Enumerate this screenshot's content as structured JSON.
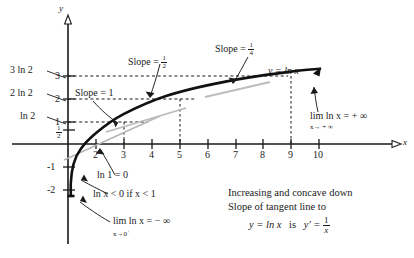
{
  "figure": {
    "curve_label": "y = ln x",
    "axes": {
      "x_axis_name": "x",
      "y_axis_name": "y",
      "x_ticks": [
        "2",
        "3",
        "4",
        "5",
        "6",
        "7",
        "8",
        "9",
        "10"
      ],
      "y_ticks_positive": [
        "1",
        "2",
        "3"
      ],
      "y_ticks_negative": [
        "-1",
        "-2"
      ],
      "y_half_tick": {
        "numerator": "1",
        "denominator": "2"
      }
    },
    "y_value_labels": [
      {
        "text": "3 ln 2",
        "value": 2.079
      },
      {
        "text": "2 ln 2",
        "value": 1.386
      },
      {
        "text": "ln 2",
        "value": 0.693
      }
    ],
    "slope_labels": [
      {
        "prefix": "Slope =",
        "value": "1",
        "at_x": 1
      },
      {
        "prefix": "Slope =",
        "numerator": "1",
        "denominator": "2",
        "at_x": 2
      },
      {
        "prefix": "Slope =",
        "numerator": "1",
        "denominator": "4",
        "at_x": 4
      }
    ],
    "annotations": {
      "ln_one": "ln 1 = 0",
      "negative_region": "ln x < 0   if   x < 1",
      "limit_zero_main": "lim ln x = − ∞",
      "limit_zero_sub": "x→0",
      "limit_zero_sup": "+",
      "limit_inf_main": "lim ln x = + ∞",
      "limit_inf_sub": "x→ + ∞"
    },
    "summary_text": {
      "line1": "Increasing and concave down",
      "line2": "Slope of tangent line to",
      "line3_a": "y = ln x",
      "line3_b": "is",
      "line3_c": "y′ =",
      "line3_num": "1",
      "line3_den": "x"
    },
    "colors": {
      "ink": "#1a1a1a",
      "curve": "#111111",
      "tangent": "#9a9a9a",
      "background": "#ffffff"
    }
  }
}
